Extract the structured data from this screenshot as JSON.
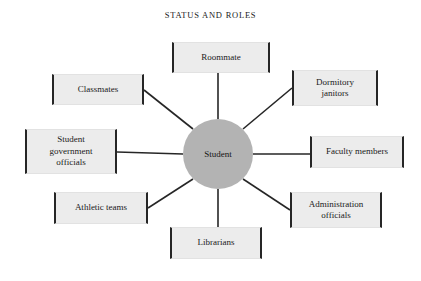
{
  "figure": {
    "title": "STATUS AND ROLES",
    "width": 421,
    "height": 281,
    "background_color": "#ffffff",
    "line_color": "#262626",
    "box_fill_color": "#ececec",
    "center_fill_color": "#b3b3b3",
    "text_color": "#1a1a1a"
  },
  "center": {
    "label": "Student",
    "shape": "circle",
    "cx": 218,
    "cy": 154,
    "r": 35
  },
  "nodes": [
    {
      "id": "roommate",
      "label": "Roommate",
      "lines": [
        "Roommate"
      ],
      "x": 172,
      "y": 42,
      "w": 98,
      "h": 31,
      "position": "top"
    },
    {
      "id": "dormitory-janitors",
      "label": "Dormitory janitors",
      "lines": [
        "Dormitory",
        "janitors"
      ],
      "x": 292,
      "y": 70,
      "w": 86,
      "h": 36,
      "position": "top-right"
    },
    {
      "id": "faculty-members",
      "label": "Faculty members",
      "lines": [
        "Faculty members"
      ],
      "x": 310,
      "y": 136,
      "w": 94,
      "h": 32,
      "position": "right"
    },
    {
      "id": "administration-officials",
      "label": "Administration officials",
      "lines": [
        "Administration",
        "officials"
      ],
      "x": 290,
      "y": 192,
      "w": 92,
      "h": 36,
      "position": "bottom-right"
    },
    {
      "id": "librarians",
      "label": "Librarians",
      "lines": [
        "Librarians"
      ],
      "x": 170,
      "y": 227,
      "w": 92,
      "h": 32,
      "position": "bottom"
    },
    {
      "id": "athletic-teams",
      "label": "Athletic teams",
      "lines": [
        "Athletic teams"
      ],
      "x": 54,
      "y": 192,
      "w": 94,
      "h": 32,
      "position": "bottom-left"
    },
    {
      "id": "student-government-officials",
      "label": "Student government officials",
      "lines": [
        "Student",
        "government",
        "officials"
      ],
      "x": 25,
      "y": 129,
      "w": 92,
      "h": 45,
      "position": "left"
    },
    {
      "id": "classmates",
      "label": "Classmates",
      "lines": [
        "Classmates"
      ],
      "x": 52,
      "y": 74,
      "w": 92,
      "h": 31,
      "position": "top-left"
    }
  ],
  "links": [
    {
      "from": "center",
      "to": "roommate",
      "x1": 218,
      "y1": 119,
      "x2": 218,
      "y2": 73
    },
    {
      "from": "center",
      "to": "dormitory-janitors",
      "x1": 243,
      "y1": 129,
      "x2": 292,
      "y2": 88
    },
    {
      "from": "center",
      "to": "faculty-members",
      "x1": 253,
      "y1": 154,
      "x2": 310,
      "y2": 154
    },
    {
      "from": "center",
      "to": "administration-officials",
      "x1": 243,
      "y1": 179,
      "x2": 290,
      "y2": 210
    },
    {
      "from": "center",
      "to": "librarians",
      "x1": 218,
      "y1": 189,
      "x2": 218,
      "y2": 227
    },
    {
      "from": "center",
      "to": "athletic-teams",
      "x1": 193,
      "y1": 179,
      "x2": 148,
      "y2": 208
    },
    {
      "from": "center",
      "to": "student-government-officials",
      "x1": 183,
      "y1": 154,
      "x2": 117,
      "y2": 152
    },
    {
      "from": "center",
      "to": "classmates",
      "x1": 193,
      "y1": 129,
      "x2": 144,
      "y2": 90
    }
  ]
}
